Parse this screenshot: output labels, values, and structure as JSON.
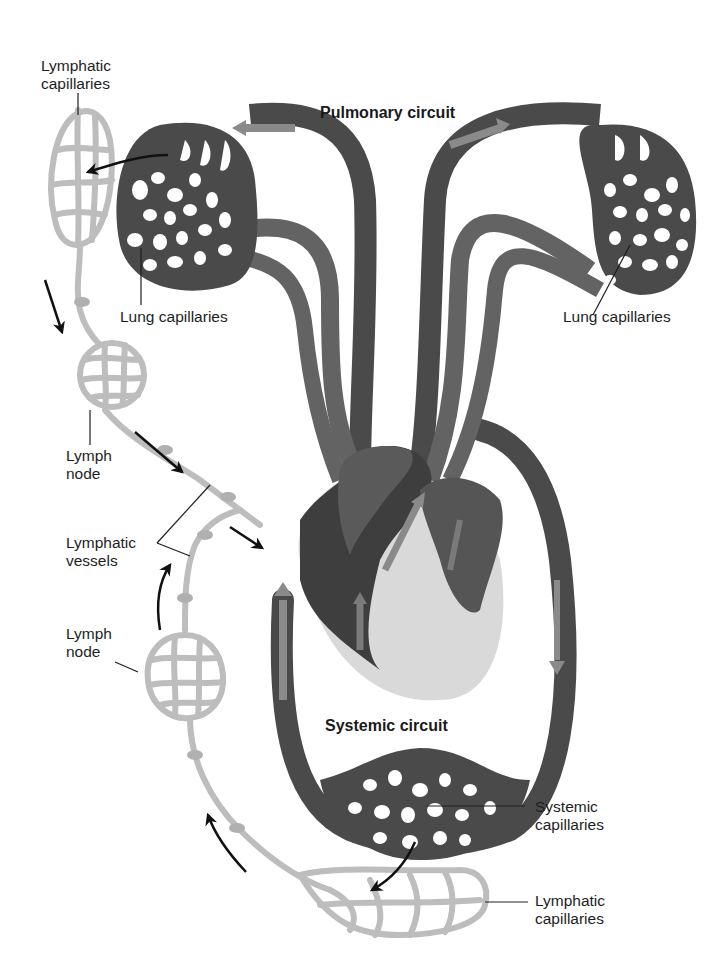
{
  "diagram": {
    "colors": {
      "vessel_dark": "#4a4a4a",
      "vessel_mid": "#636363",
      "flow_arrow": "#8a8a8a",
      "lymph": "#bdbdbd",
      "lymph_outline": "#a8a8a8",
      "heart_shadow": "#d9d9d9",
      "label_text": "#1e1e1e",
      "background": "#ffffff"
    },
    "titles": {
      "pulmonary": "Pulmonary circuit",
      "systemic": "Systemic circuit"
    },
    "labels": {
      "lymphatic_capillaries_top": [
        "Lymphatic",
        "capillaries"
      ],
      "lung_capillaries_left": "Lung capillaries",
      "lung_capillaries_right": "Lung capillaries",
      "lymph_node_upper": [
        "Lymph",
        "node"
      ],
      "lymphatic_vessels": [
        "Lymphatic",
        "vessels"
      ],
      "lymph_node_lower": [
        "Lymph",
        "node"
      ],
      "systemic_capillaries": [
        "Systemic",
        "capillaries"
      ],
      "lymphatic_capillaries_bottom": [
        "Lymphatic",
        "capillaries"
      ]
    },
    "structures": [
      "lung-capillary-bed-left",
      "lung-capillary-bed-right",
      "heart",
      "systemic-capillary-bed",
      "lymphatic-capillaries-top",
      "lymphatic-capillaries-bottom",
      "lymph-node-upper",
      "lymph-node-lower",
      "lymphatic-vessels"
    ],
    "flow_arrows": [
      {
        "from": "lung-capillaries-left",
        "to": "lymphatic-capillaries-top"
      },
      {
        "direction": "down",
        "location": "left lymphatic vessel, upper"
      },
      {
        "direction": "down-right",
        "location": "below upper lymph node"
      },
      {
        "direction": "down-right",
        "location": "toward heart vein"
      },
      {
        "direction": "up",
        "location": "beside lower lymph vessel"
      },
      {
        "direction": "up",
        "location": "lower-left lymph vessel"
      },
      {
        "from": "systemic-capillaries",
        "to": "lymphatic-capillaries-bottom"
      }
    ]
  }
}
